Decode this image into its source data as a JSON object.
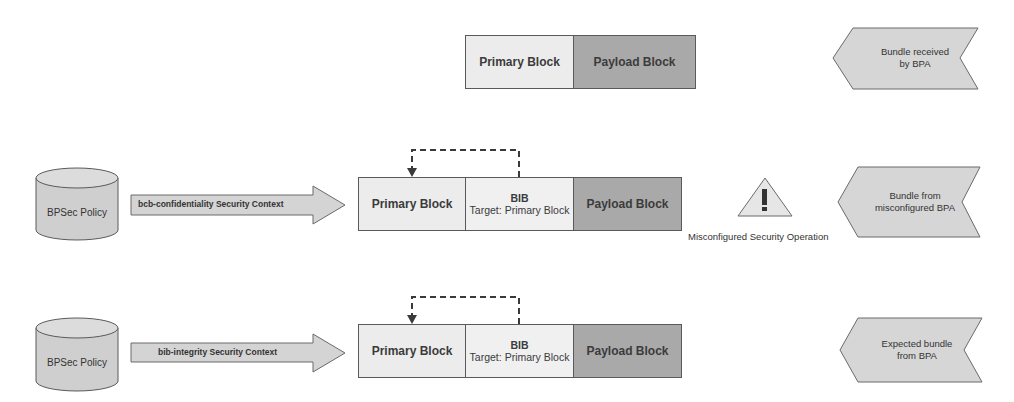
{
  "rows": [
    {
      "id": "received",
      "blocks": {
        "primary": "Primary Block",
        "payload": "Payload Block"
      },
      "chevron": {
        "line1": "Bundle received",
        "line2": "by BPA"
      }
    },
    {
      "id": "misconfigured",
      "policy": "BPSec Policy",
      "context_arrow": "bcb-confidentiality Security Context",
      "blocks": {
        "primary": "Primary Block",
        "bib_title": "BIB",
        "bib_target": "Target: Primary Block",
        "payload": "Payload Block"
      },
      "warning": {
        "icon": "warning-triangle-icon",
        "label": "Misconfigured Security Operation"
      },
      "chevron": {
        "line1": "Bundle from",
        "line2": "misconfigured BPA"
      }
    },
    {
      "id": "expected",
      "policy": "BPSec Policy",
      "context_arrow": "bib-integrity Security Context",
      "blocks": {
        "primary": "Primary Block",
        "bib_title": "BIB",
        "bib_target": "Target: Primary Block",
        "payload": "Payload Block"
      },
      "chevron": {
        "line1": "Expected bundle",
        "line2": "from BPA"
      }
    }
  ],
  "colors": {
    "primary_fill": "#ececec",
    "bib_fill": "#f0f0f0",
    "payload_fill": "#a9a9a9",
    "shape_fill": "#d4d4d4",
    "outline": "#5a5a5a"
  }
}
